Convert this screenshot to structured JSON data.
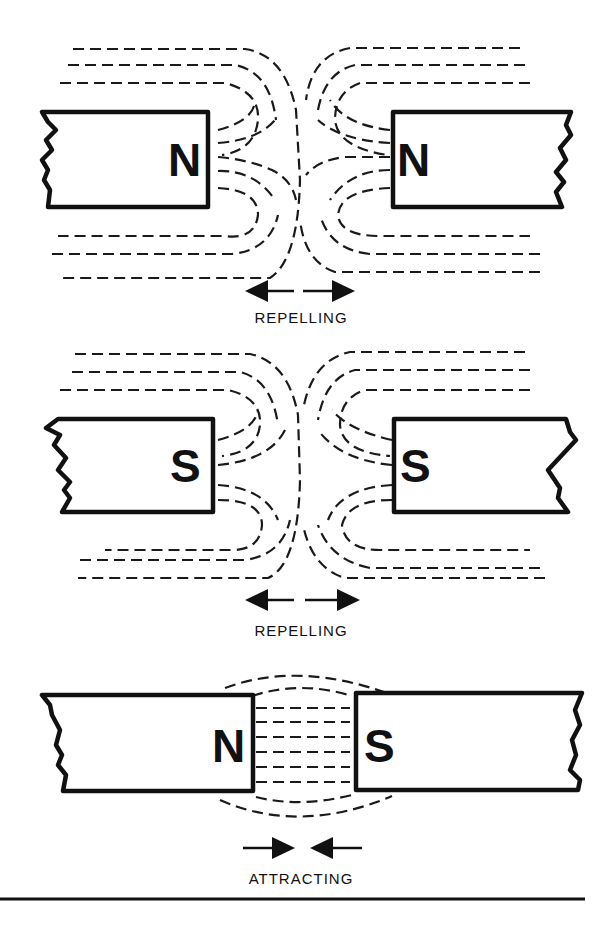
{
  "diagram": {
    "panels": [
      {
        "id": "n-n",
        "left_pole": "N",
        "right_pole": "N",
        "interaction": "repelling",
        "caption": "REPELLING",
        "arrow_direction": "outward"
      },
      {
        "id": "s-s",
        "left_pole": "S",
        "right_pole": "S",
        "interaction": "repelling",
        "caption": "REPELLING",
        "arrow_direction": "outward"
      },
      {
        "id": "n-s",
        "left_pole": "N",
        "right_pole": "S",
        "interaction": "attracting",
        "caption": "ATTRACTING",
        "arrow_direction": "inward"
      }
    ],
    "colors": {
      "ink": "#111111",
      "background": "#ffffff"
    }
  }
}
